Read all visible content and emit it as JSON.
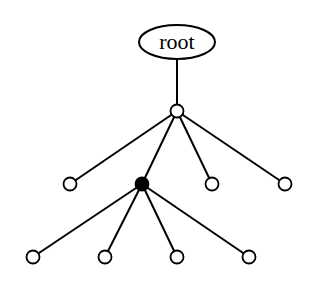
{
  "diagram": {
    "type": "tree",
    "root": {
      "label": "root",
      "x": 177,
      "y": 42,
      "rx": 38,
      "ry": 17
    },
    "node_radius": 6.5,
    "nodes": [
      {
        "id": "n1",
        "x": 177,
        "y": 111,
        "filled": false,
        "parent": "root"
      },
      {
        "id": "n2",
        "x": 70,
        "y": 184,
        "filled": false,
        "parent": "n1"
      },
      {
        "id": "n3",
        "x": 142,
        "y": 184,
        "filled": true,
        "parent": "n1"
      },
      {
        "id": "n4",
        "x": 212,
        "y": 184,
        "filled": false,
        "parent": "n1"
      },
      {
        "id": "n5",
        "x": 285,
        "y": 184,
        "filled": false,
        "parent": "n1"
      },
      {
        "id": "n6",
        "x": 33,
        "y": 257,
        "filled": false,
        "parent": "n3"
      },
      {
        "id": "n7",
        "x": 105,
        "y": 257,
        "filled": false,
        "parent": "n3"
      },
      {
        "id": "n8",
        "x": 177,
        "y": 257,
        "filled": false,
        "parent": "n3"
      },
      {
        "id": "n9",
        "x": 249,
        "y": 257,
        "filled": false,
        "parent": "n3"
      }
    ]
  }
}
